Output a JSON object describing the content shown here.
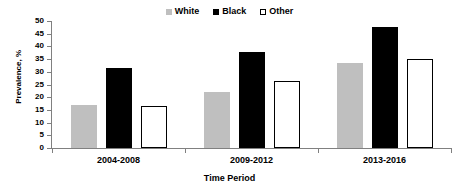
{
  "chart_data": {
    "type": "bar",
    "title": "",
    "subtitle": "",
    "xlabel": "Time Period",
    "ylabel": "Prevalence, %",
    "categories": [
      "2004-2008",
      "2009-2012",
      "2013-2016"
    ],
    "series": [
      {
        "name": "White",
        "values": [
          17.0,
          22.0,
          33.5
        ],
        "color": "#BFBFBF",
        "edge_color": "#BFBFBF"
      },
      {
        "name": "Black",
        "values": [
          31.5,
          37.8,
          47.7
        ],
        "color": "#000000",
        "edge_color": "#000000"
      },
      {
        "name": "Other",
        "values": [
          16.5,
          26.4,
          35.0
        ],
        "color": "#FFFFFF",
        "edge_color": "#000000"
      }
    ],
    "ylim": [
      0,
      50
    ],
    "ytick_labels": [
      "0",
      "5",
      "10",
      "15",
      "20",
      "25",
      "30",
      "35",
      "40",
      "45",
      "50"
    ],
    "ytick_values": [
      0,
      5,
      10,
      15,
      20,
      25,
      30,
      35,
      40,
      45,
      50
    ],
    "grid": false,
    "legend_position": "top-center",
    "legend_entries": [
      "White",
      "Black",
      "Other"
    ],
    "axis_color": "#808080"
  }
}
